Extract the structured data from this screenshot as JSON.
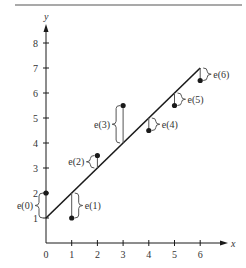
{
  "chart_data": {
    "type": "scatter",
    "title": "",
    "xlabel": "x",
    "ylabel": "y",
    "xlim": [
      0,
      6.8
    ],
    "ylim": [
      0,
      8.6
    ],
    "grid": false,
    "x_ticks": [
      "0",
      "1",
      "2",
      "3",
      "4",
      "5",
      "6"
    ],
    "y_ticks": [
      "1",
      "2",
      "3",
      "4",
      "5",
      "6",
      "7",
      "8"
    ],
    "series": [
      {
        "name": "data points",
        "type": "scatter",
        "x": [
          0,
          1,
          2,
          3,
          4,
          5,
          6
        ],
        "y": [
          2,
          1,
          3.5,
          5.5,
          4.5,
          5.5,
          6.5
        ]
      },
      {
        "name": "fitted line",
        "type": "line",
        "x": [
          0,
          6
        ],
        "y": [
          1,
          7
        ]
      }
    ],
    "annotations": [
      {
        "label": "e(0)",
        "x": 0,
        "from": 1,
        "to": 2
      },
      {
        "label": "e(1)",
        "x": 1,
        "from": 2,
        "to": 1
      },
      {
        "label": "e(2)",
        "x": 2,
        "from": 3,
        "to": 3.5
      },
      {
        "label": "e(3)",
        "x": 3,
        "from": 4,
        "to": 5.5
      },
      {
        "label": "e(4)",
        "x": 4,
        "from": 5,
        "to": 4.5
      },
      {
        "label": "e(5)",
        "x": 5,
        "from": 6,
        "to": 5.5
      },
      {
        "label": "e(6)",
        "x": 6,
        "from": 7,
        "to": 6.5
      }
    ],
    "colors": {
      "ink": "#1a1a1a",
      "text": "#333333",
      "rule": "#555555"
    }
  }
}
